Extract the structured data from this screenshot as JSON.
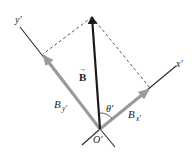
{
  "diagram": {
    "type": "vector-components",
    "colors": {
      "axis": "#2a2a2a",
      "vector_B": "#1a1a1a",
      "components": "#9a9a9a",
      "dashed": "#444444",
      "background": "#ffffff"
    },
    "labels": {
      "y_axis": "y′",
      "x_axis": "x′",
      "vector": "B",
      "vector_arrow": "→",
      "comp_y_main": "B",
      "comp_y_sub": "y′",
      "comp_x_main": "B",
      "comp_x_sub": "x′",
      "angle": "θ′",
      "origin": "O′"
    }
  }
}
